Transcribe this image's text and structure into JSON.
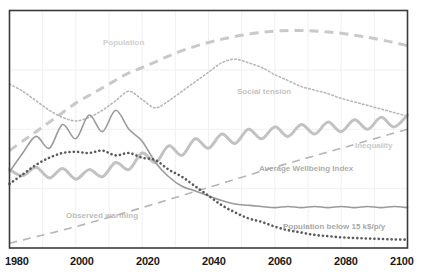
{
  "chart_data": {
    "type": "line",
    "title": "",
    "subtitle": "",
    "xlabel": "",
    "ylabel": "",
    "xlim": [
      1980,
      2100
    ],
    "ylim": [
      0,
      100
    ],
    "grid": true,
    "grid_step_years": 10,
    "legend_position": "inline-annotations",
    "x_ticks": [
      "1980",
      "2000",
      "2020",
      "2040",
      "2060",
      "2080",
      "2100"
    ],
    "x_tick_values": [
      1980,
      2000,
      2020,
      2040,
      2060,
      2080,
      2100
    ],
    "y_ticks": [],
    "colors": {
      "population": "#c9c9c9",
      "social_tension": "#b8b8b8",
      "inequality": "#c2c2c2",
      "average_wellbeing_index": "#9a9a9a",
      "observed_warming": "#b5b5b5",
      "population_below_15k": "#5a5a5a",
      "frame": "#3a3a3a",
      "grid": "#f0f0f0",
      "tick_text": "#1a1a1a"
    },
    "series": [
      {
        "name": "Population",
        "label": "Population",
        "style": "dashed-thick",
        "color": "#c9c9c9",
        "label_x": 1996,
        "label_y": 83,
        "x": [
          1980,
          1985,
          1990,
          1995,
          2000,
          2005,
          2010,
          2015,
          2020,
          2025,
          2030,
          2035,
          2040,
          2045,
          2050,
          2055,
          2060,
          2065,
          2070,
          2075,
          2080,
          2085,
          2090,
          2095,
          2100
        ],
        "values": [
          41,
          46,
          51,
          56,
          61,
          65,
          69,
          73,
          76,
          79,
          82,
          84.5,
          86.5,
          88.2,
          89.6,
          90.6,
          91.3,
          91.6,
          91.5,
          91.1,
          90.4,
          89.4,
          88.2,
          86.8,
          85.2
        ]
      },
      {
        "name": "Social tension",
        "label": "Social tension",
        "style": "dotted-fine",
        "color": "#b8b8b8",
        "label_x": 2045,
        "label_y": 63,
        "x": [
          1980,
          1984,
          1988,
          1992,
          1996,
          2000,
          2004,
          2008,
          2012,
          2016,
          2020,
          2024,
          2028,
          2032,
          2036,
          2040,
          2044,
          2048,
          2052,
          2056,
          2060,
          2064,
          2068,
          2072,
          2076,
          2080,
          2084,
          2088,
          2092,
          2096,
          2100
        ],
        "values": [
          69,
          66,
          62,
          58,
          55,
          53.5,
          55,
          58,
          62,
          66,
          62.5,
          59,
          62,
          66,
          70,
          74,
          78,
          79.5,
          78,
          76,
          73,
          70.5,
          68,
          66.5,
          65,
          63,
          61.5,
          60,
          58.5,
          57,
          55.5
        ]
      },
      {
        "name": "Inequality",
        "label": "Inequality",
        "style": "solid-thick-wavy",
        "color": "#c2c2c2",
        "label_x": 2079,
        "label_y": 41,
        "x": [
          1980,
          1984,
          1988,
          1992,
          1996,
          2000,
          2004,
          2008,
          2012,
          2016,
          2020,
          2024,
          2028,
          2032,
          2036,
          2040,
          2044,
          2048,
          2052,
          2056,
          2060,
          2064,
          2068,
          2072,
          2076,
          2080,
          2084,
          2088,
          2092,
          2096,
          2100
        ],
        "values": [
          33,
          30.5,
          34,
          29.5,
          33.5,
          29,
          33,
          30,
          36,
          33,
          40,
          36,
          43,
          39,
          46,
          42,
          48,
          44,
          50,
          46,
          51,
          47,
          52,
          48,
          53,
          49,
          54,
          50,
          55,
          51,
          56
        ]
      },
      {
        "name": "Average Wellbeing Index",
        "label": "Average Wellbeing Index",
        "style": "solid-thin-wavy",
        "color": "#9a9a9a",
        "label_x": 2056,
        "label_y": 28,
        "x": [
          1980,
          1984,
          1988,
          1992,
          1996,
          2000,
          2004,
          2008,
          2012,
          2016,
          2020,
          2024,
          2028,
          2032,
          2036,
          2040,
          2044,
          2048,
          2052,
          2056,
          2060,
          2064,
          2068,
          2072,
          2076,
          2080,
          2084,
          2088,
          2092,
          2096,
          2100
        ],
        "values": [
          32,
          40,
          47,
          42,
          52,
          46,
          56,
          49,
          58,
          50,
          45,
          36,
          30,
          26,
          24,
          22,
          20,
          18.5,
          18,
          17.5,
          17,
          17.5,
          17,
          17.5,
          17,
          17.5,
          17,
          17.5,
          17,
          17.5,
          17
        ]
      },
      {
        "name": "Observed warming",
        "label": "Observed warming",
        "style": "dashed-long",
        "color": "#b5b5b5",
        "label_x": 2001,
        "label_y": 12,
        "x": [
          1980,
          2000,
          2020,
          2040,
          2060,
          2080,
          2100
        ],
        "values": [
          2,
          9,
          17,
          25.5,
          34,
          42,
          50
        ]
      },
      {
        "name": "Population below 15 k$/p/y",
        "label": "Population below 15 k$/p/y",
        "style": "dotted-bold",
        "color": "#5a5a5a",
        "label_x": 2062,
        "label_y": 10,
        "x": [
          1980,
          1984,
          1988,
          1992,
          1996,
          2000,
          2004,
          2008,
          2012,
          2016,
          2020,
          2024,
          2028,
          2032,
          2036,
          2040,
          2044,
          2048,
          2052,
          2056,
          2060,
          2064,
          2068,
          2072,
          2076,
          2080,
          2084,
          2088,
          2092,
          2096,
          2100
        ],
        "values": [
          27,
          31,
          35,
          38,
          40,
          40.5,
          40,
          41,
          39,
          40,
          38,
          37,
          33,
          30,
          26,
          22,
          18,
          15,
          12.5,
          11,
          9,
          7.5,
          6.5,
          5.5,
          5,
          4.5,
          4.2,
          4,
          3.8,
          3.6,
          3.5
        ]
      }
    ]
  },
  "axis": {
    "ticks": [
      {
        "label": "1980",
        "value": 1980
      },
      {
        "label": "2000",
        "value": 2000
      },
      {
        "label": "2020",
        "value": 2020
      },
      {
        "label": "2040",
        "value": 2040
      },
      {
        "label": "2060",
        "value": 2060
      },
      {
        "label": "2080",
        "value": 2080
      },
      {
        "label": "2100",
        "value": 2100
      }
    ]
  },
  "annotations": {
    "population": "Population",
    "social_tension": "Social tension",
    "inequality": "Inequality",
    "average_wellbeing_index": "Average Wellbeing Index",
    "observed_warming": "Observed warming",
    "population_below_15k": "Population below 15 k$/p/y"
  }
}
